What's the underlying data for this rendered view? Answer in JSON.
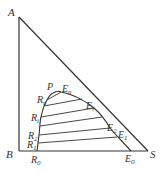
{
  "diagram": {
    "type": "ternary-phase-diagram-right-triangle",
    "vertices": {
      "A": "A",
      "B": "B",
      "S": "S"
    },
    "plait_point": "P",
    "raffinate_points": [
      "R0",
      "R1",
      "R2",
      "Ri",
      "Rn"
    ],
    "extract_points": [
      "E0",
      "E1",
      "E2",
      "Ei",
      "En"
    ],
    "labels": {
      "A": "A",
      "B": "B",
      "S": "S",
      "P": "P",
      "R0": "R",
      "R0_sub": "0",
      "R1": "R",
      "R1_sub": "1",
      "R2": "R",
      "R2_sub": "2",
      "Ri": "R",
      "Ri_sub": "i",
      "Rn": "R",
      "Rn_sub": "n",
      "E0": "E",
      "E0_sub": "0",
      "E1": "E",
      "E1_sub": "1",
      "E2": "E",
      "E2_sub": "2",
      "Ei": "E",
      "Ei_sub": "i",
      "En": "E",
      "En_sub": "n"
    },
    "colors": {
      "line": "#333333",
      "background": "#ffffff"
    }
  }
}
